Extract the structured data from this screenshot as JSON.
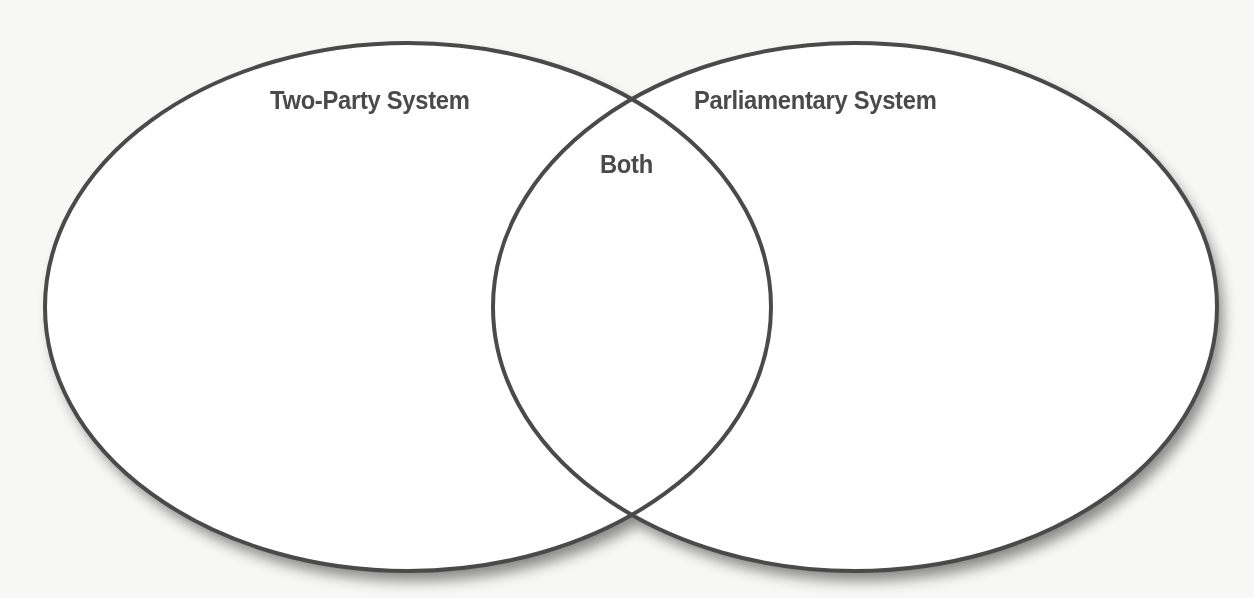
{
  "diagram": {
    "type": "venn",
    "sets": [
      {
        "name": "Two-Party System",
        "label": "Two-Party System"
      },
      {
        "name": "Parliamentary System",
        "label": "Parliamentary System"
      }
    ],
    "intersection": {
      "label": "Both"
    }
  },
  "colors": {
    "background": "#f7f7f5",
    "outline": "#4a4a4a",
    "fill": "#ffffff",
    "text": "#4a4a4a"
  }
}
